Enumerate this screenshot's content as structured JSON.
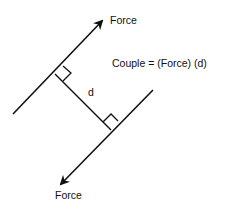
{
  "diagram": {
    "title": "Force couple",
    "labels": {
      "force_top": "Force",
      "force_bottom": "Force",
      "distance": "d",
      "equation": "Couple = (Force) (d)"
    },
    "colors": {
      "line": "#111111",
      "background": "#ffffff"
    },
    "elements": {
      "upper_force_line": {
        "from": [
          13,
          114
        ],
        "to": [
          102,
          21
        ],
        "arrow": "end",
        "direction": "up-right"
      },
      "lower_force_line": {
        "from": [
          153,
          90
        ],
        "to": [
          61,
          184
        ],
        "arrow": "end",
        "direction": "down-left"
      },
      "perpendicular_distance": {
        "from": [
          55,
          74
        ],
        "to": [
          111,
          130
        ]
      },
      "right_angle_markers": 2
    }
  }
}
